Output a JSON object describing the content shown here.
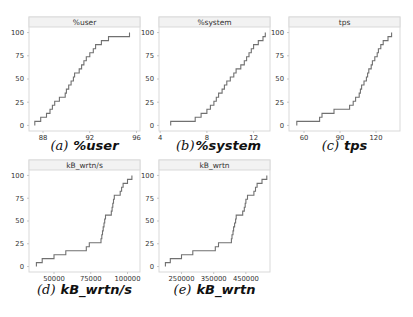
{
  "chart_data": [
    {
      "type": "line",
      "subtype": "ecdf-step",
      "title": "%user",
      "caption_letter": "(a)",
      "caption_name": "%user",
      "xlabel": "",
      "ylabel": "",
      "xlim": [
        86.8,
        96.3
      ],
      "ylim": [
        -6,
        106
      ],
      "xticks": [
        88,
        92,
        96
      ],
      "yticks": [
        0,
        25,
        50,
        75,
        100
      ],
      "grid": false,
      "x": [
        87.3,
        87.8,
        88.3,
        88.6,
        88.8,
        89.0,
        89.4,
        89.9,
        90.0,
        90.2,
        90.4,
        90.6,
        90.7,
        91.1,
        91.3,
        91.5,
        91.7,
        92.0,
        92.3,
        92.5,
        93.0,
        93.6,
        95.4
      ],
      "y": [
        4.3,
        8.7,
        13.0,
        17.4,
        21.7,
        26.1,
        30.4,
        34.8,
        39.1,
        43.5,
        47.8,
        52.2,
        56.5,
        60.9,
        65.2,
        69.6,
        73.9,
        78.3,
        82.6,
        87.0,
        91.3,
        95.7,
        100
      ]
    },
    {
      "type": "line",
      "subtype": "ecdf-step",
      "title": "%system",
      "caption_letter": "(b)",
      "caption_name": "%system",
      "xlabel": "",
      "ylabel": "",
      "xlim": [
        3.9,
        13.4
      ],
      "ylim": [
        -6,
        106
      ],
      "xticks": [
        4,
        8,
        12
      ],
      "yticks": [
        0,
        25,
        50,
        75,
        100
      ],
      "grid": false,
      "x": [
        4.9,
        7.0,
        7.5,
        8.0,
        8.3,
        8.6,
        8.8,
        9.0,
        9.3,
        9.5,
        9.7,
        10.0,
        10.3,
        10.5,
        10.9,
        11.2,
        11.4,
        11.6,
        11.8,
        12.0,
        12.4,
        12.8,
        13.0
      ],
      "y": [
        4.3,
        8.7,
        13.0,
        17.4,
        21.7,
        26.1,
        30.4,
        34.8,
        39.1,
        43.5,
        47.8,
        52.2,
        56.5,
        60.9,
        65.2,
        69.6,
        73.9,
        78.3,
        82.6,
        87.0,
        91.3,
        95.7,
        100
      ]
    },
    {
      "type": "line",
      "subtype": "ecdf-step",
      "title": "tps",
      "caption_letter": "(c)",
      "caption_name": "tps",
      "xlabel": "",
      "ylabel": "",
      "xlim": [
        47.5,
        140.0
      ],
      "ylim": [
        -6,
        106
      ],
      "xticks": [
        60,
        90,
        120
      ],
      "yticks": [
        0,
        25,
        50,
        75,
        100
      ],
      "grid": false,
      "x": [
        54,
        73,
        75,
        85,
        98,
        101,
        103,
        106,
        107,
        108,
        110,
        112,
        113,
        114,
        116,
        117,
        119,
        121,
        122,
        124,
        126,
        130,
        133
      ],
      "y": [
        4.3,
        8.7,
        13.0,
        17.4,
        21.7,
        26.1,
        30.4,
        34.8,
        39.1,
        43.5,
        47.8,
        52.2,
        56.5,
        60.9,
        65.2,
        69.6,
        73.9,
        78.3,
        82.6,
        87.0,
        91.3,
        95.7,
        100
      ]
    },
    {
      "type": "line",
      "subtype": "ecdf-step",
      "title": "kB_wrtn/s",
      "caption_letter": "(d)",
      "caption_name": "kB_wrtn/s",
      "xlabel": "",
      "ylabel": "",
      "xlim": [
        33000,
        108500
      ],
      "ylim": [
        -6,
        106
      ],
      "xticks": [
        50000,
        75000,
        100000
      ],
      "yticks": [
        0,
        25,
        50,
        75,
        100
      ],
      "grid": false,
      "x": [
        38000,
        42000,
        50000,
        58000,
        72000,
        74000,
        82000,
        82500,
        83000,
        83500,
        84000,
        84500,
        85000,
        89000,
        89500,
        90000,
        90500,
        91000,
        95000,
        96000,
        97000,
        100000,
        103000
      ],
      "y": [
        4.3,
        8.7,
        13.0,
        17.4,
        21.7,
        26.1,
        30.4,
        34.8,
        39.1,
        43.5,
        47.8,
        52.2,
        56.5,
        60.9,
        65.2,
        69.6,
        73.9,
        78.3,
        82.6,
        87.0,
        91.3,
        95.7,
        100
      ]
    },
    {
      "type": "line",
      "subtype": "ecdf-step",
      "title": "kB_wrtn",
      "caption_letter": "(e)",
      "caption_name": "kB_wrtn",
      "xlabel": "",
      "ylabel": "",
      "xlim": [
        180000,
        525000
      ],
      "ylim": [
        -6,
        106
      ],
      "xticks": [
        250000,
        350000,
        450000
      ],
      "yticks": [
        0,
        25,
        50,
        75,
        100
      ],
      "grid": false,
      "x": [
        200000,
        215000,
        250000,
        285000,
        355000,
        365000,
        405000,
        407000,
        410000,
        412000,
        415000,
        418000,
        420000,
        440000,
        445000,
        448000,
        450000,
        455000,
        475000,
        480000,
        485000,
        500000,
        515000
      ],
      "y": [
        4.3,
        8.7,
        13.0,
        17.4,
        21.7,
        26.1,
        30.4,
        34.8,
        39.1,
        43.5,
        47.8,
        52.2,
        56.5,
        60.9,
        65.2,
        69.6,
        73.9,
        78.3,
        82.6,
        87.0,
        91.3,
        95.7,
        100
      ]
    }
  ]
}
